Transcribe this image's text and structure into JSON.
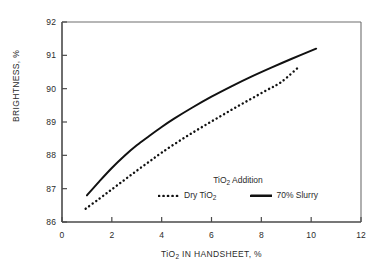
{
  "chart_data": {
    "type": "line",
    "title": "",
    "xlabel": "TiO2 IN HANDSHEET, %",
    "ylabel": "BRIGHTNESS, %",
    "xlabel_parts": {
      "pre": "TiO",
      "sub": "2",
      "post": " IN HANDSHEET, %"
    },
    "xlim": [
      0,
      12
    ],
    "ylim": [
      86,
      92
    ],
    "xticks": [
      "0",
      "2",
      "4",
      "6",
      "8",
      "10",
      "12"
    ],
    "yticks": [
      "86",
      "87",
      "88",
      "89",
      "90",
      "91",
      "92"
    ],
    "xtick_values": [
      0,
      2,
      4,
      6,
      8,
      10,
      12
    ],
    "ytick_values": [
      86,
      87,
      88,
      89,
      90,
      91,
      92
    ],
    "grid": false,
    "legend_position": "inside-lower-right",
    "legend_title": "TiO2 Addition",
    "legend_title_parts": {
      "pre": "TiO",
      "sub": "2",
      "post": " Addition"
    },
    "series": [
      {
        "name": "Dry TiO2",
        "name_parts": {
          "pre": "Dry TiO",
          "sub": "2",
          "post": ""
        },
        "style": "dotted",
        "color": "#111111",
        "x": [
          0.95,
          1.5,
          2.0,
          2.5,
          3.0,
          3.5,
          4.0,
          4.6,
          5.2,
          5.8,
          6.4,
          7.0,
          7.6,
          8.2,
          8.8,
          9.5
        ],
        "y": [
          86.4,
          86.7,
          86.98,
          87.26,
          87.54,
          87.81,
          88.08,
          88.38,
          88.66,
          88.93,
          89.19,
          89.45,
          89.7,
          89.95,
          90.2,
          90.65
        ]
      },
      {
        "name": "70% Slurry",
        "name_parts": {
          "pre": "70% Slurry",
          "sub": "",
          "post": ""
        },
        "style": "solid",
        "color": "#111111",
        "x": [
          1.0,
          1.5,
          2.0,
          2.5,
          3.0,
          3.5,
          4.0,
          4.5,
          5.2,
          6.0,
          6.8,
          7.6,
          8.4,
          9.2,
          10.2
        ],
        "y": [
          86.8,
          87.22,
          87.62,
          87.98,
          88.3,
          88.58,
          88.85,
          89.1,
          89.42,
          89.76,
          90.07,
          90.36,
          90.63,
          90.89,
          91.2
        ]
      }
    ]
  },
  "axis": {
    "y_title_text": "BRIGHTNESS, %"
  }
}
